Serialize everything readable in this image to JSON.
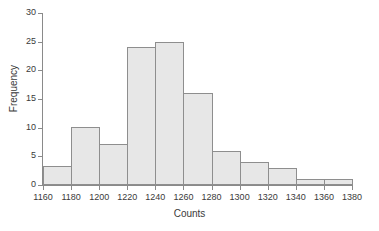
{
  "chart_data": {
    "type": "bar",
    "subtype": "histogram",
    "title": "",
    "xlabel": "Counts",
    "ylabel": "Frequency",
    "xlim": [
      1160,
      1380
    ],
    "ylim": [
      0,
      30
    ],
    "bin_width": 20,
    "grid": false,
    "legend": null,
    "x_ticks": [
      1160,
      1180,
      1200,
      1220,
      1240,
      1260,
      1280,
      1300,
      1320,
      1340,
      1360,
      1380
    ],
    "x_tick_labels": [
      "1160",
      "1180",
      "1200",
      "1220",
      "1240",
      "1260",
      "1280",
      "1300",
      "1320",
      "1340",
      "1360",
      "1380"
    ],
    "y_ticks": [
      0,
      5,
      10,
      15,
      20,
      25,
      30
    ],
    "y_tick_labels": [
      "0",
      "5",
      "10",
      "15",
      "20",
      "25",
      "30"
    ],
    "bin_edges": [
      1160,
      1180,
      1200,
      1220,
      1240,
      1260,
      1280,
      1300,
      1320,
      1340,
      1360,
      1380
    ],
    "categories": [
      "1160-1180",
      "1180-1200",
      "1200-1220",
      "1220-1240",
      "1240-1260",
      "1260-1280",
      "1280-1300",
      "1300-1320",
      "1320-1340",
      "1340-1360",
      "1360-1380"
    ],
    "values": [
      3.4,
      10.2,
      7.1,
      24,
      25,
      16,
      6,
      4,
      3,
      1,
      1
    ],
    "bars": [
      {
        "label": "1160-1180",
        "x0": 1160,
        "x1": 1180,
        "value": 3.4
      },
      {
        "label": "1180-1200",
        "x0": 1180,
        "x1": 1200,
        "value": 10.2
      },
      {
        "label": "1200-1220",
        "x0": 1200,
        "x1": 1220,
        "value": 7.1
      },
      {
        "label": "1220-1240",
        "x0": 1220,
        "x1": 1240,
        "value": 24
      },
      {
        "label": "1240-1260",
        "x0": 1240,
        "x1": 1260,
        "value": 25
      },
      {
        "label": "1260-1280",
        "x0": 1260,
        "x1": 1280,
        "value": 16
      },
      {
        "label": "1280-1300",
        "x0": 1280,
        "x1": 1300,
        "value": 6
      },
      {
        "label": "1300-1320",
        "x0": 1300,
        "x1": 1320,
        "value": 4
      },
      {
        "label": "1320-1340",
        "x0": 1320,
        "x1": 1340,
        "value": 3
      },
      {
        "label": "1340-1360",
        "x0": 1340,
        "x1": 1360,
        "value": 1
      },
      {
        "label": "1360-1380",
        "x0": 1360,
        "x1": 1380,
        "value": 1
      }
    ],
    "colors": {
      "bar_fill": "#e7e7e7",
      "bar_edge": "#8e8e8e",
      "axis": "#8a8a8a",
      "text": "#3a3a3a",
      "background": "#ffffff"
    }
  }
}
